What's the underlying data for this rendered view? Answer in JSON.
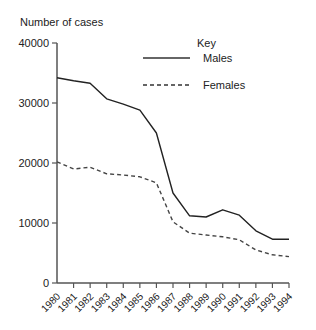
{
  "chart_data": {
    "type": "line",
    "title": "",
    "ylabel": "Number of cases",
    "xlabel": "",
    "ylim": [
      0,
      40000
    ],
    "yticks": [
      0,
      10000,
      20000,
      30000,
      40000
    ],
    "categories": [
      "1980",
      "1981",
      "1982",
      "1983",
      "1984",
      "1985",
      "1986",
      "1987",
      "1988",
      "1989",
      "1990",
      "1991",
      "1992",
      "1993",
      "1994"
    ],
    "series": [
      {
        "name": "Males",
        "style": "solid",
        "values": [
          34200,
          33700,
          33300,
          30700,
          29800,
          28800,
          25000,
          15000,
          11200,
          11000,
          12200,
          11300,
          8700,
          7300,
          7300
        ]
      },
      {
        "name": "Females",
        "style": "dashed",
        "values": [
          20200,
          19000,
          19300,
          18200,
          18000,
          17700,
          16700,
          10200,
          8300,
          8000,
          7700,
          7200,
          5500,
          4700,
          4400
        ]
      }
    ],
    "legend": {
      "title": "Key",
      "position": "top-right",
      "entries": [
        "Males",
        "Females"
      ]
    },
    "grid": false
  }
}
